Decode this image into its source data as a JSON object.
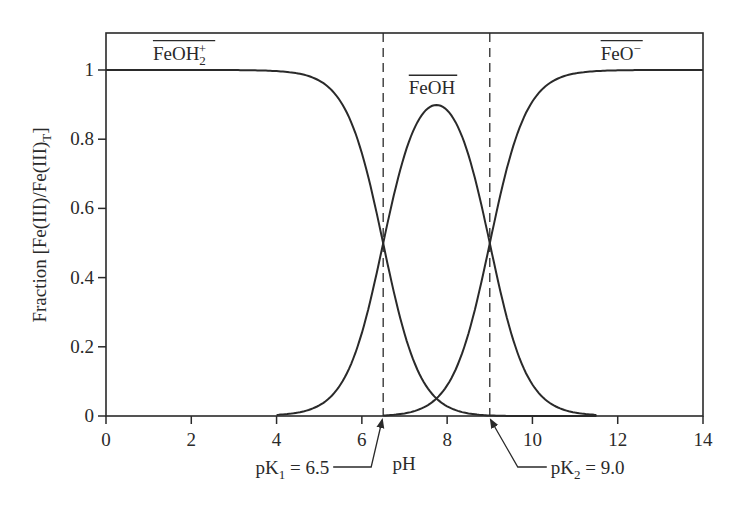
{
  "chart_data": {
    "type": "line",
    "title": "",
    "xlabel": "pH",
    "ylabel": "Fraction [Fe(III)/Fe(III)T]",
    "ylabel_parts": {
      "main": "Fraction [Fe(III)/Fe(III)",
      "sub": "T",
      "close": "]"
    },
    "xlim": [
      0,
      14
    ],
    "ylim": [
      0,
      1.1
    ],
    "x_ticks": [
      0,
      2,
      4,
      6,
      8,
      10,
      12,
      14
    ],
    "x_tick_labels": [
      "0",
      "2",
      "4",
      "6",
      "8",
      "10",
      "12",
      "14"
    ],
    "y_ticks": [
      0,
      0.2,
      0.4,
      0.6,
      0.8,
      1
    ],
    "y_tick_labels": [
      "0",
      "0.2",
      "0.4",
      "0.6",
      "0.8",
      "1"
    ],
    "grid": false,
    "legend": "none (inline labels)",
    "pK1": 6.5,
    "pK2": 9.0,
    "series": [
      {
        "name": "FeOH2+",
        "label_main": "FeOH",
        "label_sub": "2",
        "label_sup": "+",
        "label_pos": {
          "x": 1.1,
          "y": 1.03
        },
        "x_range": [
          0,
          11.5
        ],
        "x": [
          0,
          2,
          4,
          5,
          5.5,
          6,
          6.5,
          7,
          7.5,
          8,
          8.5,
          9,
          10,
          11,
          11.5
        ],
        "values": [
          1.0,
          1.0,
          0.997,
          0.969,
          0.908,
          0.759,
          0.499,
          0.24,
          0.085,
          0.03,
          0.009,
          0.003,
          0.0,
          0.0,
          0.0
        ]
      },
      {
        "name": "FeOH",
        "label_main": "FeOH",
        "label_sub": "",
        "label_sup": "",
        "label_pos": {
          "x": 7.1,
          "y": 0.93
        },
        "x_range": [
          4,
          11.5
        ],
        "x": [
          4,
          5,
          6,
          6.5,
          7,
          7.5,
          7.75,
          8,
          8.5,
          9,
          9.5,
          10,
          11,
          11.5
        ],
        "values": [
          0.003,
          0.03,
          0.24,
          0.497,
          0.752,
          0.87,
          0.893,
          0.87,
          0.752,
          0.497,
          0.24,
          0.09,
          0.009,
          0.003
        ]
      },
      {
        "name": "FeO-",
        "label_main": "FeO",
        "label_sub": "",
        "label_sup": "−",
        "label_pos": {
          "x": 11.6,
          "y": 1.03
        },
        "x_range": [
          6.5,
          14
        ],
        "x": [
          6.5,
          7,
          8,
          8.5,
          9,
          9.5,
          10,
          10.5,
          11,
          12,
          13,
          14
        ],
        "values": [
          0.003,
          0.008,
          0.1,
          0.24,
          0.5,
          0.76,
          0.909,
          0.969,
          0.99,
          0.999,
          1.0,
          1.0
        ]
      }
    ],
    "annotations": [
      {
        "text_main": "pK",
        "text_sub": "1",
        "text_rest": " = 6.5",
        "points_to_x": 6.5,
        "type": "arrow"
      },
      {
        "text_main": "pK",
        "text_sub": "2",
        "text_rest": " = 9.0",
        "points_to_x": 9.0,
        "type": "arrow"
      }
    ],
    "vertical_dashed_lines": [
      6.5,
      9.0
    ],
    "colors": {
      "line": "#2a2a2a",
      "background": "#ffffff"
    }
  }
}
